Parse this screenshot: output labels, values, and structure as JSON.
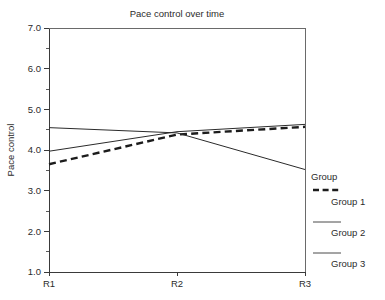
{
  "chart_data": {
    "type": "line",
    "title": "Pace control over time",
    "xlabel": "",
    "ylabel": "Pace control",
    "categories": [
      "R1",
      "R2",
      "R3"
    ],
    "x": [
      "R1",
      "R2",
      "R3"
    ],
    "ylim": [
      1.0,
      7.0
    ],
    "ytick_labels": [
      "1.0",
      "2.0",
      "3.0",
      "4.0",
      "5.0",
      "6.0",
      "7.0"
    ],
    "ytick_values": [
      1.0,
      2.0,
      3.0,
      4.0,
      5.0,
      6.0,
      7.0
    ],
    "yminor_values": [
      1.5,
      2.5,
      3.5,
      4.5,
      5.5,
      6.5
    ],
    "grid": false,
    "legend_position": "right",
    "legend_title": "Group",
    "series": [
      {
        "name": "Group 1",
        "style": "dashed",
        "color": "#1c1c1c",
        "values": [
          3.65,
          4.38,
          4.57
        ]
      },
      {
        "name": "Group 2",
        "style": "solid",
        "color": "#2b2b2b",
        "values": [
          3.97,
          4.45,
          4.63
        ]
      },
      {
        "name": "Group 3",
        "style": "solid",
        "color": "#2b2b2b",
        "values": [
          4.55,
          4.42,
          3.52
        ]
      }
    ]
  },
  "figure": {
    "title": "Pace control over time",
    "y_axis_label": "Pace control",
    "y_ticks": [
      "7.0",
      "6.0",
      "5.0",
      "4.0",
      "3.0",
      "2.0",
      "1.0"
    ],
    "x_ticks": [
      "R1",
      "R2",
      "R3"
    ],
    "background_color": "#ffffff",
    "axis_color": "#3a3a3a"
  },
  "legend": {
    "title": "Group",
    "entries": [
      {
        "label": "Group 1",
        "style": "dashed"
      },
      {
        "label": "Group 2",
        "style": "solid"
      },
      {
        "label": "Group 3",
        "style": "solid"
      }
    ]
  }
}
